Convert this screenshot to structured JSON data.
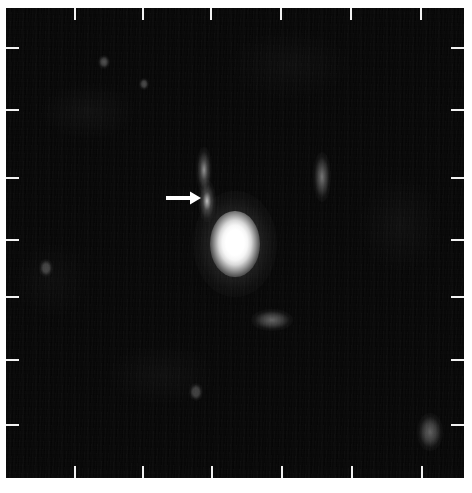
{
  "figure": {
    "kind": "astronomical-image",
    "background_color": "#050505",
    "tick_color": "#f2f2f2",
    "annotation_color": "#ffffff",
    "frame": {
      "x": 6,
      "y": 8,
      "width": 458,
      "height": 470
    }
  },
  "axes": {
    "top_ticks": [
      75,
      143,
      211,
      281,
      351,
      421
    ],
    "bottom_ticks": [
      75,
      143,
      212,
      282,
      352,
      422
    ],
    "left_ticks": [
      48,
      110,
      178,
      240,
      297,
      360,
      425
    ],
    "right_ticks": [
      48,
      110,
      178,
      240,
      297,
      360,
      425
    ],
    "tick_length_px": 12,
    "tick_labels": []
  },
  "annotations": [
    {
      "name": "companion-arrow",
      "type": "arrow",
      "direction": "right",
      "shaft_x": 166,
      "shaft_y": 198,
      "shaft_length": 24,
      "head_length": 11,
      "head_width": 13,
      "color": "#ffffff"
    }
  ],
  "sources": [
    {
      "name": "primary",
      "role": "bright-central-source",
      "x": 235,
      "y": 244,
      "width": 26,
      "height": 38,
      "peak_color": "#ffffff",
      "saturated": true
    },
    {
      "name": "companion",
      "role": "arrow-marked-faint-source",
      "x": 207,
      "y": 201,
      "width": 9,
      "height": 22,
      "peak_color": "#bdbdbd"
    },
    {
      "name": "faint-streak-upper",
      "role": "faint-source",
      "x": 204,
      "y": 170,
      "width": 8,
      "height": 24,
      "peak_color": "#8c8c8c"
    },
    {
      "name": "faint-streak-right",
      "role": "faint-source",
      "x": 322,
      "y": 177,
      "width": 9,
      "height": 26,
      "peak_color": "#6e6e6e"
    },
    {
      "name": "faint-patch-lower-right",
      "role": "faint-source",
      "x": 272,
      "y": 320,
      "width": 20,
      "height": 12,
      "peak_color": "#5e5e5e"
    },
    {
      "name": "faint-patch-far-right",
      "role": "faint-source",
      "x": 430,
      "y": 432,
      "width": 12,
      "height": 20,
      "peak_color": "#5a5a5a"
    },
    {
      "name": "faint-dot-upper-left",
      "role": "faint-source",
      "x": 104,
      "y": 62,
      "width": 6,
      "height": 7,
      "peak_color": "#4c4c4c"
    },
    {
      "name": "faint-dot-upper-mid",
      "role": "faint-source",
      "x": 144,
      "y": 84,
      "width": 5,
      "height": 6,
      "peak_color": "#434343"
    },
    {
      "name": "faint-dot-mid-left",
      "role": "faint-source",
      "x": 46,
      "y": 268,
      "width": 7,
      "height": 9,
      "peak_color": "#3d3d3d"
    },
    {
      "name": "faint-dot-lower-mid",
      "role": "faint-source",
      "x": 196,
      "y": 392,
      "width": 7,
      "height": 9,
      "peak_color": "#3a3a3a"
    }
  ]
}
